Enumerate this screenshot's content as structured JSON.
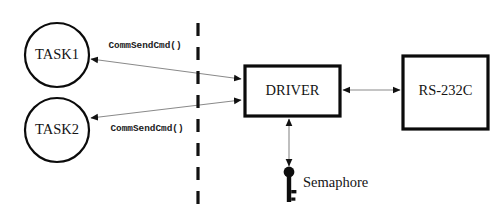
{
  "diagram": {
    "colors": {
      "background": "#ffffff",
      "stroke": "#0b0b0b",
      "edge": "#8a8a8a",
      "text": "#141414",
      "fill": "#ffffff"
    },
    "nodes": [
      {
        "id": "task1",
        "label": "TASK1",
        "shape": "circle",
        "cx": 57,
        "cy": 55,
        "r": 32
      },
      {
        "id": "task2",
        "label": "TASK2",
        "shape": "circle",
        "cx": 57,
        "cy": 130,
        "r": 32
      },
      {
        "id": "driver",
        "label": "DRIVER",
        "shape": "rect",
        "x": 245,
        "y": 66,
        "w": 95,
        "h": 50
      },
      {
        "id": "rs232c",
        "label": "RS-232C",
        "shape": "rect",
        "x": 403,
        "y": 56,
        "w": 85,
        "h": 73
      }
    ],
    "edges": [
      {
        "id": "task1-driver",
        "from": "driver",
        "to": "task1",
        "label": "CommSendCmd()",
        "arrowheads": "both",
        "label_x": 145,
        "label_y": 46
      },
      {
        "id": "task2-driver",
        "from": "driver",
        "to": "task2",
        "label": "CommSendCmd()",
        "arrowheads": "both",
        "label_x": 147,
        "label_y": 129
      },
      {
        "id": "driver-rs232c",
        "from": "driver",
        "to": "rs232c",
        "label": "",
        "arrowheads": "both"
      },
      {
        "id": "driver-semaphore",
        "from": "driver",
        "to": "semaphore",
        "label": "",
        "arrowheads": "both"
      }
    ],
    "divider": {
      "id": "boundary-divider",
      "style": "dashed",
      "x": 198,
      "y1": 23,
      "y2": 205
    },
    "semaphore": {
      "id": "semaphore",
      "label": "Semaphore",
      "icon": "key-icon",
      "label_x": 303,
      "label_y": 184,
      "head_cx": 289,
      "head_cy": 172,
      "head_r": 5.4
    }
  }
}
